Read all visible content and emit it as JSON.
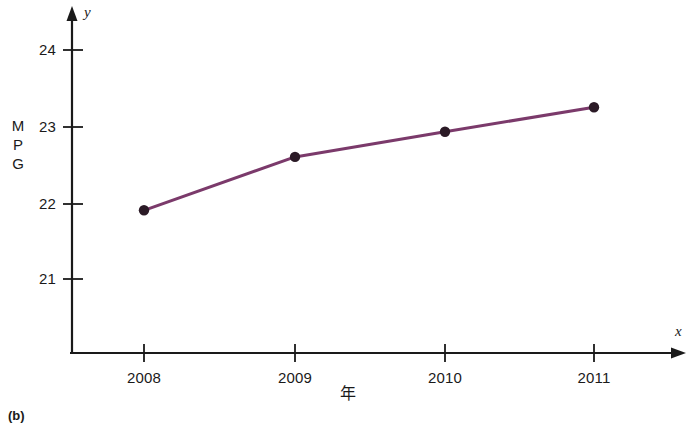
{
  "figure": {
    "panel_label": "(b)",
    "y_axis_name": "y",
    "x_axis_name": "x",
    "y_axis_title_chars": [
      "M",
      "P",
      "G"
    ],
    "x_axis_title": "年"
  },
  "chart_data": {
    "type": "line",
    "title": "",
    "subtitle": "",
    "xlabel": "年",
    "ylabel": "MPG",
    "categories": [
      "2008",
      "2009",
      "2010",
      "2011"
    ],
    "x": [
      2008,
      2009,
      2010,
      2011
    ],
    "values": [
      21.9,
      22.6,
      22.93,
      23.25
    ],
    "series": [
      {
        "name": "MPG",
        "values": [
          21.9,
          22.6,
          22.93,
          23.25
        ],
        "line_color": "#7B3A6B",
        "marker_color": "#2B1A26"
      }
    ],
    "x_tick_labels": [
      "2008",
      "2009",
      "2010",
      "2011"
    ],
    "y_tick_labels": [
      "21",
      "22",
      "23",
      "24"
    ],
    "y_ticks": [
      21,
      22,
      23,
      24
    ],
    "ylim": [
      20.5,
      24.6
    ],
    "xlim": [
      2007.55,
      2011.6
    ],
    "grid": false,
    "legend": false,
    "legend_position": "none",
    "axis_style": "arrow-ended L-axes",
    "annotations": [
      "(b)"
    ]
  },
  "colors": {
    "line": "#7B3A6B",
    "marker": "#2B1A26",
    "axis": "#1a1a1a",
    "background": "#ffffff"
  }
}
